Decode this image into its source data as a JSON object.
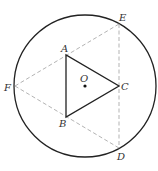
{
  "diagram": {
    "circle": {
      "center_label": "O",
      "cx": 85,
      "cy": 86,
      "r": 71
    },
    "points": {
      "A": {
        "label": "A",
        "x": 66,
        "y": 55
      },
      "B": {
        "label": "B",
        "x": 66,
        "y": 117
      },
      "C": {
        "label": "C",
        "x": 119,
        "y": 86
      },
      "D": {
        "label": "D",
        "x": 119,
        "y": 148
      },
      "E": {
        "label": "E",
        "x": 119,
        "y": 24
      },
      "F": {
        "label": "F",
        "x": 15,
        "y": 86
      },
      "O": {
        "label": "O",
        "x": 85,
        "y": 86
      }
    },
    "solid_segments": [
      [
        "A",
        "B"
      ],
      [
        "B",
        "C"
      ],
      [
        "C",
        "A"
      ]
    ],
    "dashed_segments": [
      [
        "F",
        "E"
      ],
      [
        "F",
        "D"
      ],
      [
        "E",
        "D"
      ]
    ],
    "colors": {
      "stroke": "#222222",
      "dashed": "#aaaaaa",
      "text": "#333333"
    }
  }
}
